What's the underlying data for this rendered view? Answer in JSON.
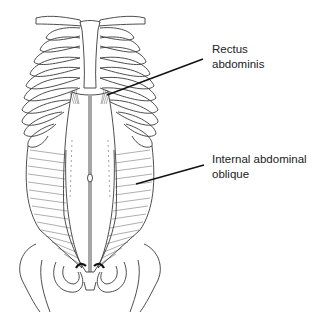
{
  "figure": {
    "labels": [
      {
        "id": "rectus",
        "lines": [
          "Rectus",
          "abdominis"
        ]
      },
      {
        "id": "oblique",
        "lines": [
          "Internal abdominal",
          "oblique"
        ]
      }
    ],
    "leader_lines": [
      {
        "label": "rectus",
        "from": [
          107,
          95
        ],
        "to": [
          203,
          59
        ]
      },
      {
        "label": "oblique",
        "from": [
          136,
          184
        ],
        "to": [
          204,
          165
        ]
      }
    ],
    "colors": {
      "line": "#3a3a3a",
      "leader": "#111111",
      "text": "#222222",
      "background": "#ffffff"
    }
  }
}
